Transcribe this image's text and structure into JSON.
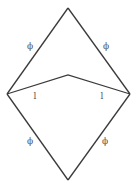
{
  "diagram": {
    "colors": {
      "stroke": "#3a3a3a",
      "label": "#555555",
      "background": "#ffffff"
    },
    "vertices": {
      "top": [
        68,
        8
      ],
      "left": [
        7,
        94
      ],
      "right": [
        130,
        94
      ],
      "middle": [
        68,
        75
      ],
      "bottom": [
        68,
        180
      ]
    },
    "edges": [
      {
        "name": "top-left",
        "from": "top",
        "to": "left",
        "label": "ϕ",
        "label_pos": [
          30,
          49
        ]
      },
      {
        "name": "top-right",
        "from": "top",
        "to": "right",
        "label": "ϕ",
        "label_pos": [
          106,
          49
        ]
      },
      {
        "name": "bottom-left",
        "from": "left",
        "to": "bottom",
        "label": "ϕ",
        "label_pos": [
          30,
          144
        ]
      },
      {
        "name": "bottom-right",
        "from": "right",
        "to": "bottom",
        "label": "ϕ",
        "label_pos": [
          105,
          144
        ]
      },
      {
        "name": "inner-left",
        "from": "left",
        "to": "middle",
        "label": "l",
        "label_pos": [
          35,
          99
        ]
      },
      {
        "name": "inner-right",
        "from": "middle",
        "to": "right",
        "label": "l",
        "label_pos": [
          102,
          99
        ]
      }
    ]
  }
}
